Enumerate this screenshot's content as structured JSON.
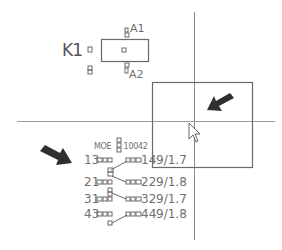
{
  "canvas": {
    "background": "#ffffff",
    "line_color": "#8a8a8a",
    "symbol_color": "#6a6a6a",
    "arrow_color": "#2f2f2f"
  },
  "crosshair": {
    "vertical_x": 194,
    "horizontal_y": 121
  },
  "selection_rect": {
    "x": 152,
    "y": 82,
    "w": 100,
    "h": 85
  },
  "component_k1": {
    "name": "K1",
    "pin_top": "A1",
    "pin_bottom": "A2"
  },
  "contact_block": {
    "label": "MOE",
    "part_number": "10042",
    "rows": [
      {
        "left": "13",
        "right": "14",
        "ref": "9/1.7"
      },
      {
        "left": "21",
        "right": "22",
        "ref": "9/1.8"
      },
      {
        "left": "31",
        "right": "32",
        "ref": "9/1.7"
      },
      {
        "left": "43",
        "right": "44",
        "ref": "9/1.8"
      }
    ]
  },
  "annotations": {
    "arrow_left": "arrow-pointing-down-right",
    "arrow_right": "arrow-pointing-down-left"
  },
  "cursor": {
    "type": "arrow-pointer",
    "x": 189,
    "y": 123
  }
}
